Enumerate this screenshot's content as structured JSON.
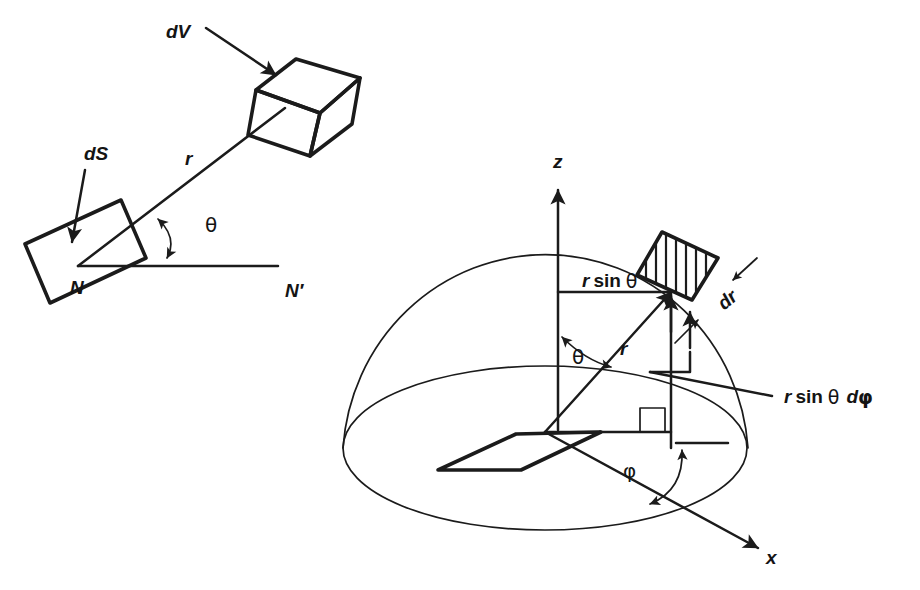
{
  "figure": {
    "background_color": "#ffffff",
    "ink_color": "#1b1b1b",
    "shade_fill": "#cfcfcf"
  },
  "left_diagram": {
    "name": "solid-angle-diagram",
    "labels": {
      "dV": "dV",
      "dS": "dS",
      "r": "r",
      "theta": "θ",
      "N": "N",
      "N_prime": "N′"
    },
    "elements": {
      "volume_element": "dV",
      "surface_element": "dS",
      "ray": "r",
      "angle": "θ",
      "origin_point": "N",
      "axis_point": "N′"
    }
  },
  "right_diagram": {
    "name": "spherical-coordinates-diagram",
    "labels": {
      "z_axis": "z",
      "x_axis": "x",
      "r": "r",
      "theta": "θ",
      "phi": "φ",
      "dr": "dr",
      "r_sin_theta": {
        "var": "r",
        "func": "sin",
        "angle": "θ"
      },
      "r_sin_theta_dphi": {
        "var": "r",
        "func": "sin",
        "angle": "θ",
        "differential": "d",
        "phi": "φ"
      }
    },
    "shapes": {
      "hemisphere": "hemisphere-dome",
      "base_ellipse": "hemisphere-base-ellipse",
      "volume_patch": "hatched-volume-element",
      "ground_patch": "shaded-ground-parallelogram",
      "right_angle_marker": "right-angle-square"
    }
  },
  "text_fragments": {
    "r_sin_theta_plain": "r sin θ",
    "r_sin_theta_dphi_plain": "r sin θ dφ",
    "dr": "dr",
    "dV": "dV",
    "dS": "dS",
    "N": "N",
    "N_prime": "N′",
    "z": "z",
    "x": "x",
    "r": "r",
    "theta": "θ",
    "phi": "φ"
  }
}
